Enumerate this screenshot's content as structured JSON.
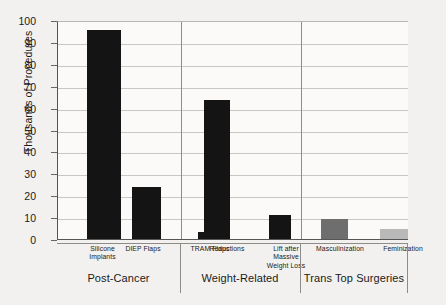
{
  "chart_data": {
    "type": "bar",
    "title": "",
    "xlabel": "",
    "ylabel": "Thousands of Procedures",
    "ylim": [
      0,
      100
    ],
    "yticks": [
      0,
      10,
      20,
      30,
      40,
      50,
      60,
      70,
      80,
      90,
      100
    ],
    "grid": true,
    "legend": "none",
    "categories": [
      "Silicone Implants",
      "DIEP Flaps",
      "TRAM Flaps",
      "Reductions",
      "Lift after Massive Weight Loss",
      "Masculinization",
      "Feminization"
    ],
    "values": [
      96,
      24,
      3.5,
      64,
      11.5,
      9.5,
      5
    ],
    "bar_colors": [
      "#141414",
      "#141414",
      "#141414",
      "#141414",
      "#141414",
      "#6e6e6e",
      "#b9b9b9"
    ],
    "groups": [
      {
        "name": "Post-Cancer",
        "categories": [
          "Silicone Implants",
          "DIEP Flaps",
          "TRAM Flaps"
        ]
      },
      {
        "name": "Weight-Related",
        "categories": [
          "Reductions",
          "Lift after Massive Weight Loss"
        ]
      },
      {
        "name": "Trans Top Surgeries",
        "categories": [
          "Masculinization",
          "Feminization"
        ]
      }
    ]
  },
  "axis": {
    "y_title": "Thousands of Procedures",
    "tick_100": "100",
    "tick_90": "90",
    "tick_80": "80",
    "tick_70": "70",
    "tick_60": "60",
    "tick_50": "50",
    "tick_40": "40",
    "tick_30": "30",
    "tick_20": "20",
    "tick_10": "10",
    "tick_0": "0"
  },
  "labels": {
    "cat_0_line1": "Silicone",
    "cat_0_line2": "Implants",
    "cat_1": "DIEP Flaps",
    "cat_2": "TRAM Flaps",
    "cat_3": "Reductions",
    "cat_4_line1": "Lift after",
    "cat_4_line2": "Massive",
    "cat_4_line3": "Weight Loss",
    "cat_5": "Masculinization",
    "cat_6": "Feminization",
    "group_0": "Post-Cancer",
    "group_1": "Weight-Related",
    "group_2": "Trans Top Surgeries"
  },
  "colors": {
    "background": "#f2f1ef",
    "plot_background": "#fbfaf8",
    "bar_dark": "#141414",
    "bar_gray": "#6e6e6e",
    "bar_light": "#b9b9b9",
    "axis": "#555555",
    "grid": "#c9c7c3"
  }
}
